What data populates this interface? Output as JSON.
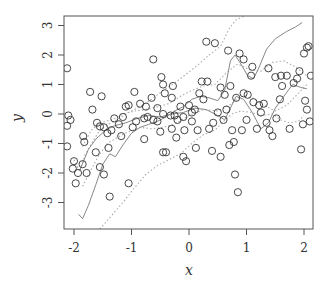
{
  "chart_data": {
    "type": "scatter",
    "title": "",
    "xlabel": "x",
    "ylabel": "y",
    "xlim": [
      -2.15,
      2.15
    ],
    "ylim": [
      -3.9,
      3.3
    ],
    "x_ticks": [
      -2,
      -1,
      0,
      1,
      2
    ],
    "y_ticks": [
      -3,
      -2,
      -1,
      0,
      1,
      2,
      3
    ],
    "x_tick_labels": [
      "-2",
      "-1",
      "0",
      "1",
      "2"
    ],
    "y_tick_labels": [
      "-3",
      "-2",
      "-1",
      "0",
      "1",
      "2",
      "3"
    ],
    "grid": false,
    "legend": null,
    "series": [
      {
        "name": "observations",
        "kind": "points",
        "marker": "open-circle",
        "color": "#333333",
        "points": [
          [
            -2.12,
            1.55
          ],
          [
            -2.1,
            -0.05
          ],
          [
            -2.06,
            -0.2
          ],
          [
            -2.12,
            -0.4
          ],
          [
            -2.12,
            -1.1
          ],
          [
            -2.0,
            -1.6
          ],
          [
            -2.02,
            -1.85
          ],
          [
            -1.97,
            -2.35
          ],
          [
            -1.93,
            -2.0
          ],
          [
            -1.85,
            -1.7
          ],
          [
            -1.78,
            -2.0
          ],
          [
            -1.84,
            -0.75
          ],
          [
            -1.82,
            -0.95
          ],
          [
            -1.68,
            0.15
          ],
          [
            -1.72,
            0.75
          ],
          [
            -1.52,
            0.6
          ],
          [
            -1.6,
            -0.3
          ],
          [
            -1.55,
            -0.42
          ],
          [
            -1.48,
            -0.45
          ],
          [
            -1.42,
            -0.65
          ],
          [
            -1.4,
            -1.15
          ],
          [
            -1.62,
            -1.3
          ],
          [
            -1.55,
            -1.8
          ],
          [
            -1.48,
            -2.05
          ],
          [
            -1.38,
            -2.8
          ],
          [
            -1.35,
            -0.55
          ],
          [
            -1.3,
            -0.15
          ],
          [
            -1.22,
            -0.35
          ],
          [
            -1.15,
            -0.1
          ],
          [
            -1.18,
            -0.75
          ],
          [
            -1.05,
            -2.35
          ],
          [
            -1.1,
            0.25
          ],
          [
            -1.05,
            0.3
          ],
          [
            -0.98,
            -0.45
          ],
          [
            -0.92,
            -0.25
          ],
          [
            -0.85,
            0.35
          ],
          [
            -0.78,
            -0.15
          ],
          [
            -0.78,
            -0.85
          ],
          [
            -0.72,
            -0.1
          ],
          [
            -0.65,
            0.55
          ],
          [
            -0.62,
            -0.2
          ],
          [
            -0.55,
            -0.25
          ],
          [
            -0.55,
            0.2
          ],
          [
            -0.5,
            -0.6
          ],
          [
            -0.45,
            0.0
          ],
          [
            -0.42,
            0.7
          ],
          [
            -0.45,
            -1.3
          ],
          [
            -0.4,
            -1.3
          ],
          [
            -0.32,
            -0.05
          ],
          [
            -0.3,
            0.55
          ],
          [
            -0.25,
            -0.05
          ],
          [
            -0.2,
            -0.2
          ],
          [
            -0.22,
            -0.8
          ],
          [
            -0.15,
            0.25
          ],
          [
            -0.08,
            -0.55
          ],
          [
            -0.1,
            -1.45
          ],
          [
            -0.05,
            -1.6
          ],
          [
            -0.1,
            -0.1
          ],
          [
            0.05,
            0.05
          ],
          [
            0.1,
            0.15
          ],
          [
            0.12,
            -1.15
          ],
          [
            -0.62,
            1.85
          ],
          [
            -0.45,
            1.0
          ],
          [
            -0.28,
            0.95
          ],
          [
            -0.48,
            1.25
          ],
          [
            0.05,
            -0.25
          ],
          [
            0.15,
            -0.55
          ],
          [
            0.18,
            0.7
          ],
          [
            0.25,
            0.5
          ],
          [
            0.32,
            1.1
          ],
          [
            0.35,
            -0.5
          ],
          [
            0.4,
            -1.25
          ],
          [
            0.42,
            -0.3
          ],
          [
            0.5,
            0.05
          ],
          [
            0.55,
            0.9
          ],
          [
            0.6,
            -0.2
          ],
          [
            0.62,
            0.65
          ],
          [
            0.65,
            0.15
          ],
          [
            0.68,
            2.15
          ],
          [
            0.72,
            0.95
          ],
          [
            0.55,
            -1.45
          ],
          [
            0.7,
            -1.05
          ],
          [
            0.75,
            -0.55
          ],
          [
            0.78,
            -0.95
          ],
          [
            0.8,
            -2.05
          ],
          [
            0.85,
            -2.65
          ],
          [
            0.88,
            2.05
          ],
          [
            0.92,
            -0.55
          ],
          [
            0.95,
            0.7
          ],
          [
            1.0,
            -0.2
          ],
          [
            1.02,
            0.65
          ],
          [
            1.08,
            1.3
          ],
          [
            1.12,
            0.4
          ],
          [
            1.18,
            -0.5
          ],
          [
            1.25,
            0.05
          ],
          [
            1.3,
            0.35
          ],
          [
            1.35,
            -0.3
          ],
          [
            1.4,
            -0.55
          ],
          [
            1.45,
            -0.75
          ],
          [
            1.5,
            1.25
          ],
          [
            1.52,
            -0.15
          ],
          [
            1.58,
            0.5
          ],
          [
            1.62,
            0.95
          ],
          [
            1.7,
            1.3
          ],
          [
            1.75,
            -0.5
          ],
          [
            1.82,
            1.05
          ],
          [
            1.88,
            1.2
          ],
          [
            1.95,
            -1.2
          ],
          [
            2.0,
            2.05
          ],
          [
            2.05,
            2.25
          ],
          [
            2.08,
            2.3
          ],
          [
            2.02,
            0.45
          ],
          [
            2.05,
            0.15
          ],
          [
            2.1,
            -0.25
          ],
          [
            1.98,
            -0.35
          ],
          [
            1.92,
            1.45
          ],
          [
            2.12,
            1.3
          ],
          [
            0.3,
            2.45
          ],
          [
            0.45,
            2.4
          ],
          [
            0.95,
            1.85
          ],
          [
            1.1,
            1.6
          ],
          [
            1.38,
            1.55
          ],
          [
            1.6,
            1.3
          ],
          [
            -0.95,
            0.75
          ],
          [
            -0.75,
            0.25
          ],
          [
            -0.3,
            -0.5
          ],
          [
            0.0,
            0.3
          ],
          [
            0.22,
            1.1
          ],
          [
            0.82,
            0.55
          ],
          [
            1.22,
            0.3
          ]
        ]
      },
      {
        "name": "fit",
        "kind": "line",
        "style": "solid",
        "color": "#888888",
        "points": [
          [
            -1.92,
            -3.4
          ],
          [
            -1.85,
            -3.55
          ],
          [
            -1.75,
            -3.1
          ],
          [
            -1.62,
            -2.4
          ],
          [
            -1.5,
            -1.7
          ],
          [
            -1.38,
            -1.35
          ],
          [
            -1.28,
            -1.45
          ],
          [
            -1.15,
            -1.05
          ],
          [
            -1.0,
            -0.65
          ],
          [
            -0.85,
            -0.45
          ],
          [
            -0.7,
            -0.35
          ],
          [
            -0.55,
            -0.25
          ],
          [
            -0.4,
            -0.1
          ],
          [
            -0.25,
            0.1
          ],
          [
            -0.1,
            0.25
          ],
          [
            0.05,
            0.5
          ],
          [
            0.2,
            0.6
          ],
          [
            0.35,
            0.55
          ],
          [
            0.5,
            0.45
          ],
          [
            0.62,
            0.8
          ],
          [
            0.72,
            1.8
          ],
          [
            0.8,
            2.0
          ],
          [
            0.9,
            1.7
          ],
          [
            1.02,
            1.3
          ],
          [
            1.12,
            1.2
          ],
          [
            1.2,
            1.5
          ],
          [
            1.35,
            2.2
          ],
          [
            1.5,
            2.55
          ],
          [
            1.7,
            2.8
          ],
          [
            1.85,
            2.95
          ],
          [
            1.97,
            3.1
          ]
        ]
      },
      {
        "name": "lower-band",
        "kind": "line",
        "style": "dotted",
        "color": "#aaaaaa",
        "points": [
          [
            -1.55,
            -3.9
          ],
          [
            -1.35,
            -3.45
          ],
          [
            -1.15,
            -3.0
          ],
          [
            -0.95,
            -2.5
          ],
          [
            -0.75,
            -2.05
          ],
          [
            -0.55,
            -1.75
          ],
          [
            -0.35,
            -1.55
          ],
          [
            -0.15,
            -1.35
          ],
          [
            0.05,
            -1.0
          ],
          [
            0.25,
            -0.7
          ],
          [
            0.45,
            -0.55
          ],
          [
            0.6,
            -0.25
          ],
          [
            0.75,
            -0.0
          ],
          [
            0.9,
            0.1
          ],
          [
            1.1,
            0.05
          ],
          [
            1.25,
            -0.05
          ],
          [
            1.45,
            0.0
          ],
          [
            1.6,
            -0.2
          ],
          [
            1.75,
            -0.3
          ],
          [
            1.9,
            -0.25
          ],
          [
            2.0,
            -0.05
          ]
        ]
      },
      {
        "name": "upper-band",
        "kind": "line",
        "style": "dotted",
        "color": "#aaaaaa",
        "points": [
          [
            -2.0,
            -1.55
          ],
          [
            -1.9,
            -1.95
          ],
          [
            -1.8,
            -1.35
          ],
          [
            -1.68,
            -0.95
          ],
          [
            -1.55,
            -0.55
          ],
          [
            -1.4,
            -0.35
          ],
          [
            -1.22,
            -0.15
          ],
          [
            -1.05,
            0.05
          ],
          [
            -0.85,
            0.25
          ],
          [
            -0.65,
            0.5
          ],
          [
            -0.45,
            0.8
          ],
          [
            -0.25,
            1.05
          ],
          [
            -0.05,
            1.35
          ],
          [
            0.15,
            1.65
          ],
          [
            0.35,
            2.0
          ],
          [
            0.55,
            2.3
          ],
          [
            0.7,
            2.9
          ],
          [
            0.82,
            3.2
          ],
          [
            1.0,
            3.35
          ],
          [
            1.2,
            3.4
          ]
        ]
      },
      {
        "name": "inner-lower-band",
        "kind": "line",
        "style": "dotted",
        "color": "#aaaaaa",
        "points": [
          [
            -1.85,
            -2.45
          ],
          [
            -1.72,
            -1.95
          ],
          [
            -1.58,
            -1.45
          ],
          [
            -1.42,
            -1.0
          ],
          [
            -1.25,
            -0.8
          ],
          [
            -1.05,
            -0.6
          ],
          [
            -0.85,
            -0.45
          ],
          [
            -0.65,
            -0.5
          ],
          [
            -0.45,
            -0.45
          ],
          [
            -0.25,
            -0.35
          ],
          [
            0.0,
            -0.05
          ],
          [
            0.25,
            0.15
          ],
          [
            0.5,
            0.1
          ],
          [
            0.7,
            0.3
          ],
          [
            0.9,
            0.6
          ],
          [
            1.1,
            0.55
          ],
          [
            1.3,
            0.3
          ],
          [
            1.5,
            0.1
          ],
          [
            1.7,
            0.3
          ],
          [
            1.9,
            0.7
          ],
          [
            2.05,
            1.0
          ]
        ]
      },
      {
        "name": "inner-upper-band",
        "kind": "line",
        "style": "dotted",
        "color": "#aaaaaa",
        "points": [
          [
            -1.85,
            -1.1
          ],
          [
            -1.7,
            -0.55
          ],
          [
            -1.55,
            -0.3
          ],
          [
            -1.35,
            -0.2
          ],
          [
            -1.15,
            0.0
          ],
          [
            -0.95,
            0.1
          ],
          [
            -0.75,
            0.15
          ],
          [
            -0.55,
            0.25
          ],
          [
            -0.35,
            0.35
          ],
          [
            -0.15,
            0.6
          ],
          [
            0.05,
            0.8
          ],
          [
            0.25,
            0.95
          ],
          [
            0.45,
            1.0
          ],
          [
            0.65,
            1.4
          ],
          [
            0.85,
            1.7
          ],
          [
            1.05,
            1.5
          ],
          [
            1.25,
            1.45
          ],
          [
            1.45,
            1.75
          ],
          [
            1.65,
            1.8
          ],
          [
            1.85,
            1.6
          ],
          [
            2.05,
            1.3
          ]
        ]
      },
      {
        "name": "local-trace",
        "kind": "line",
        "style": "solid",
        "color": "#888888",
        "points": [
          [
            -1.9,
            -1.9
          ],
          [
            -1.75,
            -1.2
          ],
          [
            -1.62,
            -0.85
          ],
          [
            -1.45,
            -0.55
          ],
          [
            -1.3,
            -0.4
          ],
          [
            -1.1,
            -0.3
          ],
          [
            -0.9,
            -0.15
          ],
          [
            -0.7,
            -0.05
          ],
          [
            -0.5,
            -0.1
          ],
          [
            -0.3,
            0.0
          ],
          [
            -0.1,
            0.05
          ],
          [
            0.1,
            0.2
          ],
          [
            0.3,
            0.15
          ],
          [
            0.5,
            -0.05
          ],
          [
            0.62,
            -0.2
          ],
          [
            0.72,
            0.2
          ],
          [
            0.82,
            0.6
          ],
          [
            0.95,
            0.5
          ],
          [
            1.1,
            0.05
          ],
          [
            1.25,
            -0.5
          ],
          [
            1.38,
            -0.3
          ],
          [
            1.5,
            0.2
          ],
          [
            1.65,
            0.6
          ],
          [
            1.8,
            1.0
          ],
          [
            1.95,
            0.9
          ],
          [
            2.05,
            0.85
          ]
        ]
      }
    ]
  },
  "axes": {
    "xlabel": "x",
    "ylabel": "y"
  }
}
